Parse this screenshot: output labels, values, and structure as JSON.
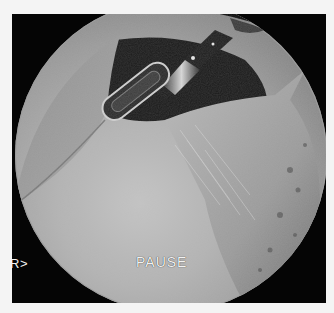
{
  "image": {
    "description": "Circular endoscopic (arthroscopic) view inside a joint, showing a metallic instrument with an elongated slot tip, smooth grey cartilage surface in the lower-left and fibrous/textured tissue on the right, on a black frame.",
    "overlay": {
      "status_text": "PAUSE",
      "side_marker": "R>"
    },
    "colors": {
      "frame": "#050505",
      "background": "#f4f4f4",
      "tissue_light": "#c4c4c4",
      "tissue_dark": "#5a5a5a",
      "overlay_text": "#f2f2f2"
    }
  }
}
